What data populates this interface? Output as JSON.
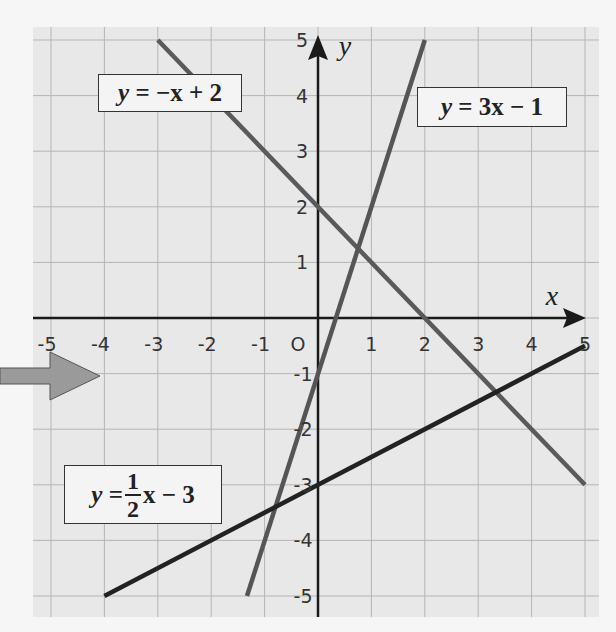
{
  "chart_data": {
    "type": "line",
    "title": "",
    "xlabel": "x",
    "ylabel": "y",
    "xlim": [
      -5,
      5
    ],
    "ylim": [
      -5,
      5
    ],
    "grid": true,
    "origin_label": "O",
    "x_ticks": [
      "-5",
      "-4",
      "-3",
      "-2",
      "-1",
      "1",
      "2",
      "3",
      "4",
      "5"
    ],
    "y_ticks": [
      "5",
      "4",
      "3",
      "2",
      "1",
      "-1",
      "-2",
      "-3",
      "-4",
      "-5"
    ],
    "series": [
      {
        "name": "y = -x + 2",
        "slope": -1,
        "intercept": 2,
        "x": [
          -3,
          5
        ],
        "y": [
          5,
          -3
        ],
        "color": "#5a5a5a"
      },
      {
        "name": "y = 3x - 1",
        "slope": 3,
        "intercept": -1,
        "x": [
          -1.33,
          2
        ],
        "y": [
          -5,
          5
        ],
        "color": "#555555"
      },
      {
        "name": "y = 1/2 x - 3",
        "slope": 0.5,
        "intercept": -3,
        "x": [
          -4,
          5
        ],
        "y": [
          -5,
          -0.5
        ],
        "color": "#222222"
      }
    ],
    "labels": {
      "line1": {
        "y": "y",
        "eq": "=",
        "rest": "−x + 2"
      },
      "line2": {
        "y": "y",
        "eq": "=",
        "rest": "3x − 1"
      },
      "line3": {
        "y": "y",
        "eq": "=",
        "num": "1",
        "den": "2",
        "rest": "x − 3"
      }
    }
  },
  "colors": {
    "plot_bg": "#e8e8e8",
    "grid": "#b5b5b5",
    "axis": "#1a1a1a",
    "pointer_arrow": "#9a9a9a"
  },
  "decorations": {
    "pointer_arrow": "left-pointing arrow indicating chart"
  }
}
